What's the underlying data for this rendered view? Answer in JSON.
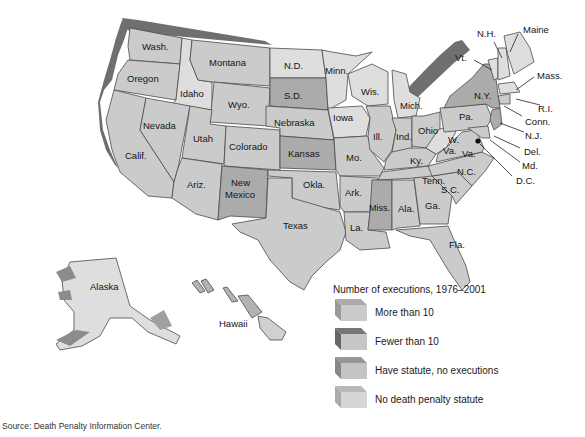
{
  "map": {
    "title": "Number of executions, 1976–2001",
    "colors": {
      "more_than_10": "#c9c9c9",
      "fewer_than_10": "#7b7b7b",
      "have_statute_no_executions": "#a9a9a9",
      "no_death_penalty_statute": "#dedede",
      "extrusion_dark": "#6e6e6e"
    },
    "states": {
      "wash": "Wash.",
      "oregon": "Oregon",
      "calif": "Calif.",
      "idaho": "Idaho",
      "nevada": "Nevada",
      "montana": "Montana",
      "wyo": "Wyo.",
      "utah": "Utah",
      "ariz": "Ariz.",
      "colorado": "Colorado",
      "new": "New",
      "mexico": "Mexico",
      "nd": "N.D.",
      "sd": "S.D.",
      "nebraska": "Nebraska",
      "kansas": "Kansas",
      "okla": "Okla.",
      "texas": "Texas",
      "minn": "Minn.",
      "iowa": "Iowa",
      "mo": "Mo.",
      "ark": "Ark.",
      "la": "La.",
      "wis": "Wis.",
      "ill": "Ill.",
      "mich": "Mich.",
      "ind": "Ind.",
      "ohio": "Ohio",
      "ky": "Ky.",
      "tenn": "Tenn.",
      "miss": "Miss.",
      "ala": "Ala.",
      "ga": "Ga.",
      "fla": "Fla.",
      "sc": "S.C.",
      "nc": "N.C.",
      "va": "Va.",
      "wv_w": "W.",
      "wv_va": "Va.",
      "pa": "Pa.",
      "ny": "N.Y.",
      "vt": "Vt.",
      "nh": "N.H.",
      "maine": "Maine",
      "mass": "Mass.",
      "ri": "R.I.",
      "conn": "Conn.",
      "nj": "N.J.",
      "del": "Del.",
      "md": "Md.",
      "dc": "D.C.",
      "alaska": "Alaska",
      "hawaii": "Hawaii"
    }
  },
  "legend": {
    "title": "Number of executions, 1976–2001",
    "items": [
      {
        "label": "More than 10",
        "top": "#ababab",
        "front": "#cbcbcb"
      },
      {
        "label": "Fewer than 10",
        "top": "#767676",
        "front": "#c6c6c6"
      },
      {
        "label": "Have statute, no executions",
        "top": "#979797",
        "front": "#c4c4c4"
      },
      {
        "label": "No death penalty statute",
        "top": "#b9b9b9",
        "front": "#d6d6d6"
      }
    ]
  },
  "source": "Source: Death Penalty Information Center."
}
